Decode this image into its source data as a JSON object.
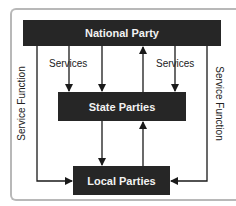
{
  "diagram": {
    "nodes": {
      "national": "National Party",
      "state": "State Parties",
      "local": "Local Parties"
    },
    "labels": {
      "services_left": "Services",
      "services_right": "Services",
      "service_function_left": "Service Function",
      "service_function_right": "Service Function"
    },
    "colors": {
      "box_fill": "#262626",
      "box_text": "#f2f2f2",
      "line": "#1a1a1a",
      "frame": "#b8b8b8"
    }
  }
}
